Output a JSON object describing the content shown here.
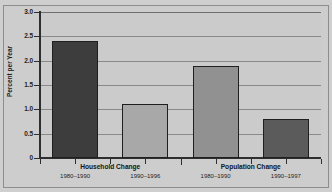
{
  "chart_data": {
    "type": "bar",
    "title": "",
    "subtitle": "",
    "xlabel": "",
    "ylabel": "Percent per Year",
    "ylim": [
      0,
      3.0
    ],
    "grid": true,
    "legend": "none",
    "y_ticks": [
      "0",
      "0.5",
      "1.0",
      "1.5",
      "2.0",
      "2.5",
      "3.0"
    ],
    "y_tick_values": [
      0,
      0.5,
      1.0,
      1.5,
      2.0,
      2.5,
      3.0
    ],
    "groups": [
      {
        "name": "Household Change",
        "bars": [
          {
            "category": "1980–1990",
            "value": 2.4,
            "color": "#3d3d3d"
          },
          {
            "category": "1990–1996",
            "value": 1.1,
            "color": "#a8a8a8"
          }
        ]
      },
      {
        "name": "Population Change",
        "bars": [
          {
            "category": "1980–1990",
            "value": 1.9,
            "color": "#919191"
          },
          {
            "category": "1990–1997",
            "value": 0.8,
            "color": "#5b5b5b"
          }
        ]
      }
    ],
    "categories": [
      "1980–1990",
      "1990–1996",
      "1980–1990",
      "1990–1997"
    ],
    "values": [
      2.4,
      1.1,
      1.9,
      0.8
    ]
  },
  "colors": {
    "figure_background": "#cfcfcf",
    "panel_background": "#cbcbcb",
    "axis": "#2e2e2e",
    "gridline": "#8a8a8a",
    "frame": "#8d8d8d",
    "text": "#1d1d1d"
  }
}
